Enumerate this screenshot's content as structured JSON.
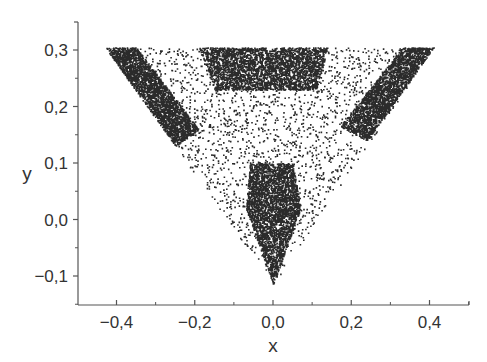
{
  "chart_data": {
    "type": "scatter",
    "title": "",
    "xlabel": "x",
    "ylabel": "y",
    "xlim": [
      -0.5,
      0.5
    ],
    "ylim": [
      -0.15,
      0.35
    ],
    "grid": false,
    "legend": null,
    "x_ticks": [
      {
        "value": -0.4,
        "label": "−0,4"
      },
      {
        "value": -0.2,
        "label": "−0,2"
      },
      {
        "value": 0.0,
        "label": "0,0"
      },
      {
        "value": 0.2,
        "label": "0,2"
      },
      {
        "value": 0.4,
        "label": "0,4"
      }
    ],
    "y_ticks": [
      {
        "value": -0.1,
        "label": "−0,1"
      },
      {
        "value": 0.0,
        "label": "0,0"
      },
      {
        "value": 0.1,
        "label": "0,1"
      },
      {
        "value": 0.2,
        "label": "0,2"
      },
      {
        "value": 0.3,
        "label": "0,3"
      }
    ],
    "x_minor_step": 0.1,
    "y_minor_step": 0.05,
    "triangle_vertices": [
      [
        -0.43,
        0.305
      ],
      [
        0.41,
        0.305
      ],
      [
        0.0,
        -0.115
      ]
    ],
    "dense_regions": [
      {
        "name": "left-corner band",
        "polygon": [
          [
            -0.43,
            0.305
          ],
          [
            -0.35,
            0.305
          ],
          [
            -0.19,
            0.16
          ],
          [
            -0.25,
            0.13
          ]
        ],
        "density": 1.0,
        "count": 2600
      },
      {
        "name": "right-corner band",
        "polygon": [
          [
            0.41,
            0.305
          ],
          [
            0.33,
            0.305
          ],
          [
            0.17,
            0.165
          ],
          [
            0.24,
            0.14
          ]
        ],
        "density": 1.0,
        "count": 2400
      },
      {
        "name": "top-center block",
        "polygon": [
          [
            -0.19,
            0.305
          ],
          [
            0.14,
            0.305
          ],
          [
            0.11,
            0.23
          ],
          [
            -0.15,
            0.23
          ]
        ],
        "density": 1.0,
        "count": 3000
      },
      {
        "name": "bottom vertex stem",
        "polygon": [
          [
            -0.06,
            0.1
          ],
          [
            0.05,
            0.1
          ],
          [
            0.07,
            0.02
          ],
          [
            0.0,
            -0.115
          ],
          [
            -0.07,
            0.02
          ]
        ],
        "density": 1.0,
        "count": 3000
      }
    ],
    "sparse_count": 2200,
    "point_color": "#2b2b2b"
  }
}
